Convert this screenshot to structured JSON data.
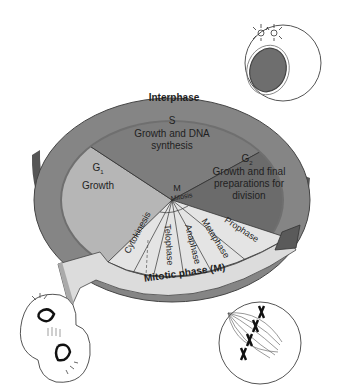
{
  "diagram": {
    "ring_label": "Interphase",
    "phases": [
      {
        "id": "S",
        "symbol": "S",
        "desc_lines": [
          "Growth and DNA",
          "synthesis"
        ]
      },
      {
        "id": "G2",
        "symbol": "G",
        "subscript": "2",
        "desc_lines": [
          "Growth and final",
          "preparations for",
          "division"
        ]
      },
      {
        "id": "G1",
        "symbol": "G",
        "subscript": "1",
        "desc_lines": [
          "Growth"
        ]
      },
      {
        "id": "M",
        "symbol": "M"
      }
    ],
    "mitosis_label": "Mitosis",
    "mitotic_stages": [
      "Prophase",
      "Metaphase",
      "Anaphase",
      "Telophase",
      "Cytokinesis"
    ],
    "mitotic_arrow_label": "Mitotic phase (M)",
    "cell_illustrations": [
      {
        "id": "interphase-cell",
        "stage": "interphase"
      },
      {
        "id": "metaphase-cell",
        "stage": "metaphase"
      },
      {
        "id": "telophase-cell",
        "stage": "telophase / cytokinesis"
      }
    ],
    "colors": {
      "ring": "#7a7a7a",
      "ring_side": "#5a5a5a",
      "s_phase": "#7c7c7c",
      "g2_phase": "#6c6c6c",
      "g1_phase": "#b4b4b4",
      "mitotic": "#e2e2e2",
      "arrow": "#dedede",
      "outline": "#333333"
    }
  }
}
